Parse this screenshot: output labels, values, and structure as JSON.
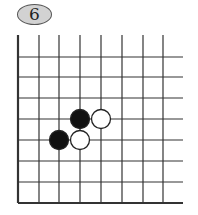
{
  "diagram": {
    "number": "6",
    "board": {
      "vertical_lines_x": [
        18,
        39,
        59,
        80,
        101,
        122,
        143,
        163
      ],
      "horizontal_lines_y": [
        57,
        77,
        98,
        119,
        140,
        161,
        182,
        203
      ],
      "line_right_end": 183,
      "line_top_start": 35,
      "line_color": "#333333",
      "edges": [
        "left",
        "bottom"
      ]
    },
    "stones": [
      {
        "color": "black",
        "x": 80,
        "y": 119
      },
      {
        "color": "white",
        "x": 101,
        "y": 119
      },
      {
        "color": "black",
        "x": 59,
        "y": 140
      },
      {
        "color": "white",
        "x": 80,
        "y": 140
      }
    ]
  }
}
